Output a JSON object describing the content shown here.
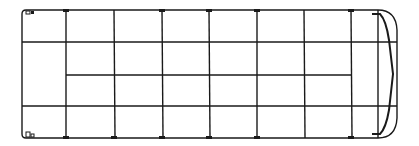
{
  "diagram": {
    "type": "vehicle-plan-view-frame",
    "stroke_color": "#1a1a1a",
    "background": "#ffffff",
    "body": {
      "left": 22,
      "top": 10,
      "right": 378,
      "bottom": 138
    },
    "vertical_members_x": [
      66,
      114,
      162,
      209,
      257,
      304,
      351
    ],
    "horizontal_members_y": [
      42,
      106
    ],
    "partial_horizontal": {
      "y": 75,
      "x_start": 66,
      "x_end": 351
    },
    "nose": {
      "x_start": 378,
      "x_tip": 397
    }
  }
}
